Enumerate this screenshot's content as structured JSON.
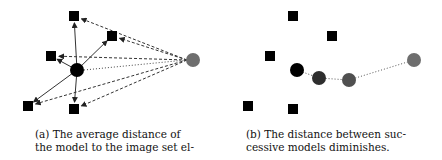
{
  "panels": [
    {
      "id": "a",
      "caption_line1": "(a) The average distance of",
      "caption_line2": "the model to the image set el-",
      "image_points": [
        [
          74,
          16
        ],
        [
          112,
          36
        ],
        [
          51,
          56
        ],
        [
          28,
          106
        ],
        [
          74,
          109
        ]
      ],
      "model": {
        "x": 77,
        "y": 70,
        "color": "#000000"
      },
      "target": {
        "x": 193,
        "y": 60,
        "color": "#6e6e6e"
      }
    },
    {
      "id": "b",
      "caption_line1": "(b) The distance between suc-",
      "caption_line2": "cessive models diminishes.",
      "image_points": [
        [
          293,
          16
        ],
        [
          332,
          36
        ],
        [
          270,
          56
        ],
        [
          248,
          106
        ],
        [
          293,
          109
        ]
      ],
      "models": [
        {
          "x": 297,
          "y": 70,
          "color": "#000000"
        },
        {
          "x": 319,
          "y": 78,
          "color": "#2e2e2e"
        },
        {
          "x": 349,
          "y": 80,
          "color": "#505050"
        },
        {
          "x": 414,
          "y": 60,
          "color": "#6e6e6e"
        }
      ]
    }
  ]
}
